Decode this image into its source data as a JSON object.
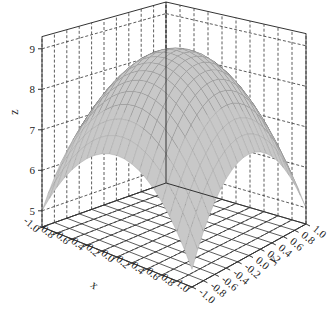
{
  "chart_data": {
    "type": "surface3d",
    "title": "",
    "function": "z = 9 - 2*x^2 - 2*y^2",
    "xlabel": "x",
    "ylabel": "y",
    "zlabel": "z",
    "x_ticks": [
      -1.0,
      -0.8,
      -0.6,
      -0.4,
      -0.2,
      0.0,
      0.2,
      0.4,
      0.6,
      0.8,
      1.0
    ],
    "y_ticks": [
      -1.0,
      -0.8,
      -0.6,
      -0.4,
      -0.2,
      0.0,
      0.2,
      0.4,
      0.6,
      0.8,
      1.0
    ],
    "z_ticks": [
      5,
      6,
      7,
      8,
      9
    ],
    "x_tick_labels": [
      "-1.0",
      "-0.8",
      "-0.6",
      "-0.4",
      "-0.2",
      "0.0",
      "0.2",
      "0.4",
      "0.6",
      "0.8",
      "1.0"
    ],
    "y_tick_labels": [
      "-1.0",
      "-0.8",
      "-0.6",
      "-0.4",
      "-0.2",
      "0.0",
      "0.2",
      "0.4",
      "0.6",
      "0.8",
      "1.0"
    ],
    "z_tick_labels": [
      "5",
      "6",
      "7",
      "8",
      "9"
    ],
    "xlim": [
      -1.0,
      1.0
    ],
    "ylim": [
      -1.0,
      1.0
    ],
    "zlim": [
      4.6,
      9.3
    ],
    "grid": true,
    "grid_style": "dashed",
    "mesh_resolution": 21,
    "colors": {
      "surface_top": "#c8c8c8",
      "surface_underside": "#3a3a3a",
      "mesh_line": "#9a9a9a",
      "box_line": "#333333",
      "grid_line": "#333333"
    }
  }
}
